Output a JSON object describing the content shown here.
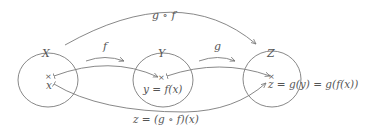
{
  "diagram": {
    "sets": [
      {
        "id": "X",
        "label": "X",
        "element_label": "x"
      },
      {
        "id": "Y",
        "label": "Y",
        "element_label": "y = f(x)"
      },
      {
        "id": "Z",
        "label": "Z",
        "element_label": "z = g(y) = g(f(x))"
      }
    ],
    "element_marker": "×",
    "set_arrows": [
      {
        "from": "X",
        "to": "Y",
        "label": "f"
      },
      {
        "from": "Y",
        "to": "Z",
        "label": "g"
      },
      {
        "from": "X",
        "to": "Z",
        "label": "g ∘ f"
      }
    ],
    "element_arrows": [
      {
        "from": "x",
        "to": "y"
      },
      {
        "from": "y",
        "to": "z"
      },
      {
        "from": "x",
        "to": "z"
      }
    ],
    "bottom_label": "z = (g ∘ f)(x)",
    "colors": {
      "stroke": "#7a7a7a",
      "text": "#555555",
      "background": "#ffffff"
    }
  }
}
